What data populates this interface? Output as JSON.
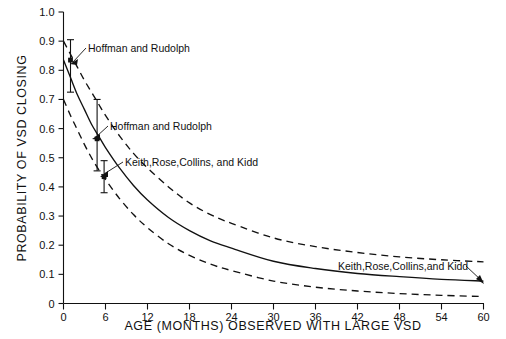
{
  "chart_data": {
    "type": "line",
    "title": "",
    "xlabel": "AGE (MONTHS) OBSERVED WITH LARGE VSD",
    "ylabel": "PROBABILITY OF VSD CLOSING",
    "xlim": [
      0,
      60
    ],
    "ylim": [
      0,
      1.0
    ],
    "grid": false,
    "legend_position": "inline-annotations",
    "xticks": [
      "0",
      "6",
      "12",
      "18",
      "24",
      "30",
      "36",
      "42",
      "48",
      "54",
      "60"
    ],
    "xtick_values": [
      0,
      6,
      12,
      18,
      24,
      30,
      36,
      42,
      48,
      54,
      60
    ],
    "yticks": [
      "0",
      "0.1",
      "0.2",
      "0.3",
      "0.4",
      "0.5",
      "0.6",
      "0.7",
      "0.8",
      "0.9",
      "1.0"
    ],
    "ytick_values": [
      0,
      0.1,
      0.2,
      0.3,
      0.4,
      0.5,
      0.6,
      0.7,
      0.8,
      0.9,
      1.0
    ],
    "x": [
      0,
      1,
      2,
      3,
      4,
      5,
      6,
      8,
      10,
      12,
      15,
      18,
      21,
      24,
      30,
      36,
      42,
      48,
      54,
      60
    ],
    "series": [
      {
        "name": "Upper confidence limit",
        "style": "dashed",
        "values": [
          0.9,
          0.855,
          0.81,
          0.765,
          0.725,
          0.685,
          0.645,
          0.575,
          0.515,
          0.465,
          0.4,
          0.345,
          0.305,
          0.275,
          0.225,
          0.195,
          0.175,
          0.16,
          0.15,
          0.143
        ]
      },
      {
        "name": "Keith, Rose, Collins, and Kidd fitted curve",
        "style": "solid",
        "values": [
          0.835,
          0.775,
          0.715,
          0.665,
          0.615,
          0.575,
          0.535,
          0.465,
          0.405,
          0.355,
          0.295,
          0.25,
          0.215,
          0.19,
          0.145,
          0.12,
          0.103,
          0.092,
          0.083,
          0.077
        ]
      },
      {
        "name": "Lower confidence limit",
        "style": "dashed",
        "values": [
          0.7,
          0.645,
          0.595,
          0.545,
          0.5,
          0.46,
          0.425,
          0.36,
          0.305,
          0.26,
          0.205,
          0.165,
          0.135,
          0.113,
          0.077,
          0.056,
          0.043,
          0.034,
          0.028,
          0.024
        ]
      }
    ],
    "data_points": [
      {
        "x": 1.0,
        "y": 0.835,
        "err_low": 0.725,
        "err_high": 0.905,
        "label": "Hoffman and Rudolph"
      },
      {
        "x": 4.8,
        "y": 0.565,
        "err_low": 0.455,
        "err_high": 0.7,
        "label": "Hoffman and Rudolph"
      },
      {
        "x": 5.8,
        "y": 0.435,
        "err_low": 0.38,
        "err_high": 0.49,
        "label": "Keith, Rose, Collins, and Kidd"
      }
    ],
    "annotations": [
      {
        "id": "annot-hoffman-1",
        "text": "Hoffman and Rudolph",
        "x": 88,
        "y": 52
      },
      {
        "id": "annot-hoffman-2",
        "text": "Hoffman and Rudolph",
        "x": 110,
        "y": 130
      },
      {
        "id": "annot-keith-left",
        "text": "Keith,Rose,Collins, and Kidd",
        "x": 125,
        "y": 166
      },
      {
        "id": "annot-keith-right",
        "text": "Keith,Rose,Collins,and Kidd",
        "x": 338,
        "y": 270
      }
    ]
  }
}
